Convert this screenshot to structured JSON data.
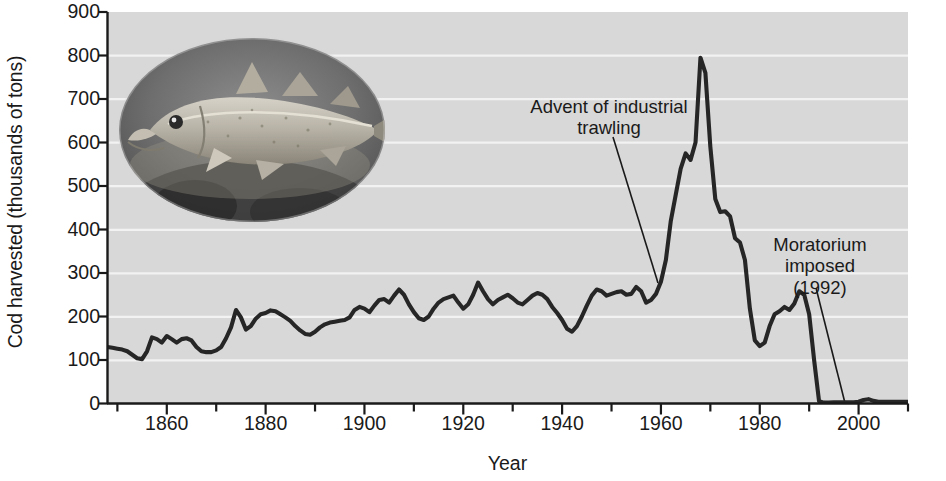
{
  "figure": {
    "background": "#ffffff",
    "plot_background": "#d8d8d8",
    "gridline_color": "#f4f4f4",
    "line_color": "#262626",
    "axis_color": "#1a1a1a"
  },
  "axes": {
    "ylabel": "Cod harvested (thousands of tons)",
    "xlabel": "Year",
    "yticks": [
      0,
      100,
      200,
      300,
      400,
      500,
      600,
      700,
      800,
      900
    ],
    "xticks_major": [
      1860,
      1880,
      1900,
      1920,
      1940,
      1960,
      1980,
      2000
    ],
    "xticks_minor": [
      1850,
      1870,
      1890,
      1910,
      1930,
      1950,
      1970,
      1990,
      2010
    ]
  },
  "annotations": [
    {
      "name": "advent-of-trawling",
      "line1": "Advent of industrial",
      "line2": "trawling",
      "target_year": 1959,
      "target_value": 250
    },
    {
      "name": "moratorium-imposed",
      "line1": "Moratorium",
      "line2": "imposed",
      "line3": "(1992)",
      "target_year": 1992,
      "target_value": 0
    }
  ],
  "image": {
    "caption": "Atlantic cod photograph",
    "shape": "oval",
    "style": "grayscale"
  },
  "chart_data": {
    "type": "line",
    "title": "",
    "xlabel": "Year",
    "ylabel": "Cod harvested (thousands of tons)",
    "xlim": [
      1848,
      2010
    ],
    "ylim": [
      0,
      900
    ],
    "grid": "horizontal",
    "legend": "none",
    "x": [
      1848,
      1849,
      1850,
      1851,
      1852,
      1853,
      1854,
      1855,
      1856,
      1857,
      1858,
      1859,
      1860,
      1861,
      1862,
      1863,
      1864,
      1865,
      1866,
      1867,
      1868,
      1869,
      1870,
      1871,
      1872,
      1873,
      1874,
      1875,
      1876,
      1877,
      1878,
      1879,
      1880,
      1881,
      1882,
      1883,
      1884,
      1885,
      1886,
      1887,
      1888,
      1889,
      1890,
      1891,
      1892,
      1893,
      1894,
      1895,
      1896,
      1897,
      1898,
      1899,
      1900,
      1901,
      1902,
      1903,
      1904,
      1905,
      1906,
      1907,
      1908,
      1909,
      1910,
      1911,
      1912,
      1913,
      1914,
      1915,
      1916,
      1917,
      1918,
      1919,
      1920,
      1921,
      1922,
      1923,
      1924,
      1925,
      1926,
      1927,
      1928,
      1929,
      1930,
      1931,
      1932,
      1933,
      1934,
      1935,
      1936,
      1937,
      1938,
      1939,
      1940,
      1941,
      1942,
      1943,
      1944,
      1945,
      1946,
      1947,
      1948,
      1949,
      1950,
      1951,
      1952,
      1953,
      1954,
      1955,
      1956,
      1957,
      1958,
      1959,
      1960,
      1961,
      1962,
      1963,
      1964,
      1965,
      1966,
      1967,
      1968,
      1969,
      1970,
      1971,
      1972,
      1973,
      1974,
      1975,
      1976,
      1977,
      1978,
      1979,
      1980,
      1981,
      1982,
      1983,
      1984,
      1985,
      1986,
      1987,
      1988,
      1989,
      1990,
      1991,
      1992,
      1993,
      1994,
      1995,
      1996,
      1997,
      1998,
      1999,
      2000,
      2001,
      2002,
      2003,
      2004,
      2005,
      2006,
      2007,
      2008,
      2009,
      2010
    ],
    "y": [
      130,
      128,
      126,
      124,
      120,
      112,
      104,
      102,
      120,
      152,
      148,
      140,
      155,
      148,
      140,
      148,
      150,
      145,
      130,
      120,
      118,
      118,
      122,
      130,
      150,
      175,
      215,
      198,
      170,
      178,
      195,
      205,
      208,
      214,
      212,
      205,
      198,
      190,
      178,
      168,
      160,
      158,
      165,
      175,
      182,
      186,
      188,
      190,
      192,
      198,
      215,
      222,
      218,
      210,
      225,
      238,
      240,
      232,
      248,
      262,
      250,
      228,
      210,
      196,
      192,
      200,
      218,
      232,
      240,
      244,
      248,
      232,
      218,
      228,
      250,
      278,
      258,
      240,
      228,
      238,
      244,
      250,
      242,
      232,
      228,
      238,
      248,
      254,
      250,
      240,
      222,
      208,
      192,
      172,
      165,
      178,
      200,
      225,
      248,
      262,
      258,
      248,
      252,
      256,
      258,
      250,
      252,
      268,
      258,
      232,
      238,
      252,
      280,
      330,
      420,
      480,
      540,
      575,
      560,
      600,
      795,
      760,
      590,
      470,
      440,
      442,
      430,
      380,
      370,
      330,
      218,
      145,
      132,
      140,
      178,
      205,
      212,
      222,
      215,
      230,
      258,
      250,
      205,
      100,
      5,
      2,
      2,
      3,
      3,
      3,
      3,
      3,
      4,
      8,
      10,
      6,
      4,
      4,
      4,
      4,
      4,
      4,
      4
    ],
    "key_points": [
      {
        "year": 1848,
        "value": 130,
        "note": "series start"
      },
      {
        "year": 1854,
        "value": 104,
        "note": "early low"
      },
      {
        "year": 1907,
        "value": 262,
        "note": "pre-war high"
      },
      {
        "year": 1942,
        "value": 165,
        "note": "wartime low"
      },
      {
        "year": 1959,
        "value": 232,
        "note": "advent of industrial trawling"
      },
      {
        "year": 1968,
        "value": 795,
        "note": "all-time peak"
      },
      {
        "year": 1978,
        "value": 132,
        "note": "post-peak crash low"
      },
      {
        "year": 1988,
        "value": 258,
        "note": "brief recovery"
      },
      {
        "year": 1992,
        "value": 5,
        "note": "moratorium imposed; stock collapse"
      },
      {
        "year": 2010,
        "value": 4,
        "note": "series end, near zero"
      }
    ]
  }
}
